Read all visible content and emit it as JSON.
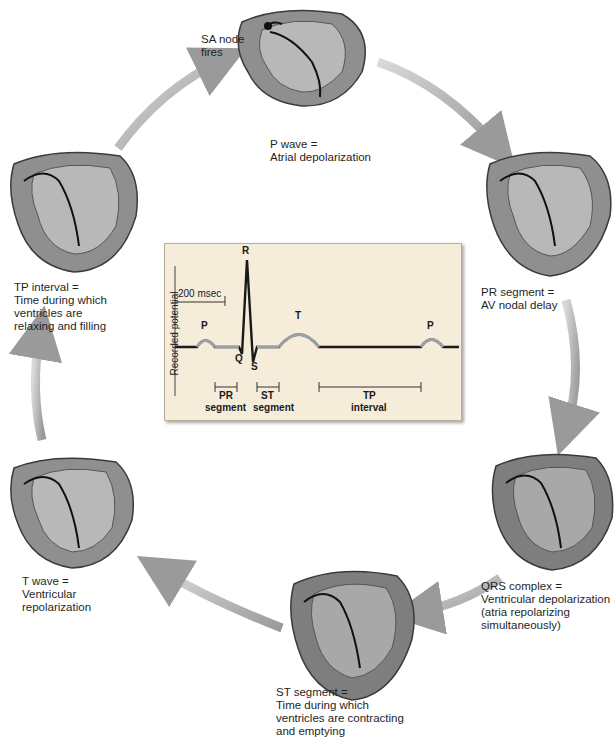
{
  "diagram": {
    "stages": [
      {
        "id": "sa-node",
        "label_lines": [
          "SA node",
          "fires"
        ]
      },
      {
        "id": "p-wave",
        "label_lines": [
          "P wave =",
          "Atrial depolarization"
        ]
      },
      {
        "id": "pr-segment",
        "label_lines": [
          "PR segment =",
          "AV nodal delay"
        ]
      },
      {
        "id": "qrs-complex",
        "label_lines": [
          "QRS complex =",
          "Ventricular depolarization",
          "(atria repolarizing",
          "simultaneously)"
        ]
      },
      {
        "id": "st-segment",
        "label_lines": [
          "ST segment =",
          "Time during which",
          "ventricles are contracting",
          "and emptying"
        ]
      },
      {
        "id": "t-wave",
        "label_lines": [
          "T wave =",
          "Ventricular",
          "repolarization"
        ]
      },
      {
        "id": "tp-interval",
        "label_lines": [
          "TP interval =",
          "Time during which",
          "ventricles are",
          "relaxing and filling"
        ]
      }
    ],
    "ecg": {
      "y_axis_label": "Recorded potential",
      "scale_bar": "200 msec",
      "wave_labels": {
        "p1": "P",
        "q": "Q",
        "r": "R",
        "s": "S",
        "t": "T",
        "p2": "P"
      },
      "intervals": [
        {
          "top": "PR",
          "bottom": "segment"
        },
        {
          "top": "ST",
          "bottom": "segment"
        },
        {
          "top": "TP",
          "bottom": "interval"
        }
      ],
      "colors": {
        "background": "#f5ecd9",
        "trace": "#1a1a1a",
        "highlight": "#9aa0a6"
      }
    },
    "colors": {
      "arrow": "#a8a8a8",
      "heart_fill": "#8a8a8a",
      "heart_dark": "#4a4a4a",
      "pathway": "#1a1a1a"
    }
  }
}
